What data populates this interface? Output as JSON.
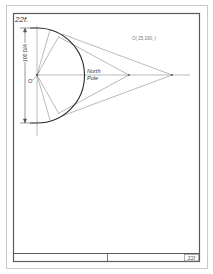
{
  "sheet": {
    "problem_number": "22f.",
    "title_block_number": "22f",
    "colors": {
      "paper": "#ffffff",
      "border": "#5a5a5a",
      "outer_border": "#c8c8c8",
      "thin_line": "#8a8a8a",
      "circle": "#2a2a2a",
      "text": "#333333",
      "light_text": "#777777"
    }
  },
  "drawing": {
    "dimension_label": "100 DIA",
    "center_label": "O'",
    "pole_label_line1": "North",
    "pole_label_line2": "Pole",
    "coordinate_note": "O( 25,190,  )"
  }
}
